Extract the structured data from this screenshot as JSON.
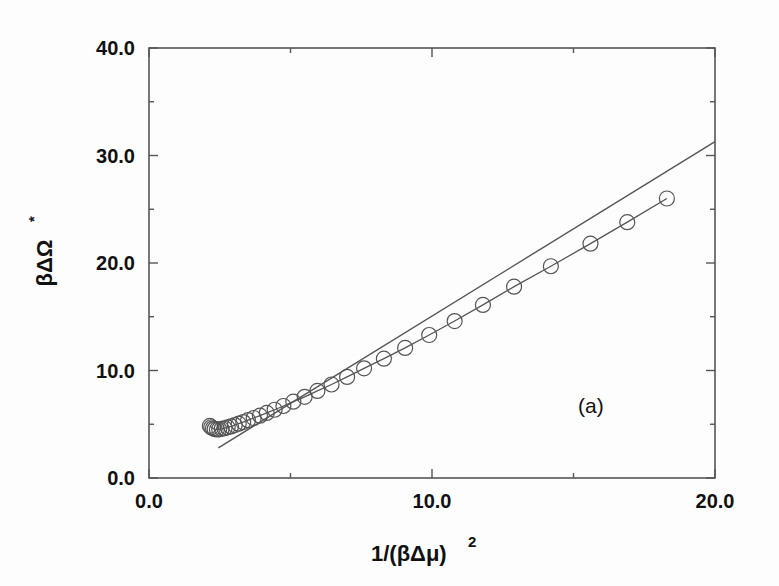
{
  "figure": {
    "panel_label": "(a)",
    "background_color": "#fdfdfd",
    "ink_color": "#555555"
  },
  "chart_data": {
    "type": "line",
    "title": "",
    "subtitle": "",
    "xlabel": "1/(βΔμ)²",
    "ylabel": "βΔΩ*",
    "xlabel_parts": {
      "base": "1/(βΔμ)",
      "exponent": "2"
    },
    "ylabel_parts": {
      "base": "βΔΩ",
      "exponent": "*"
    },
    "xlim": [
      0.0,
      20.0
    ],
    "ylim": [
      0.0,
      40.0
    ],
    "grid": false,
    "legend": null,
    "annotations": [
      {
        "text": "(a)",
        "x": 15.2,
        "y": 7.0
      }
    ],
    "xticks": [
      0.0,
      10.0,
      20.0
    ],
    "xtick_labels": [
      "0.0",
      "10.0",
      "20.0"
    ],
    "xminor_ticks": [
      5.0,
      15.0
    ],
    "yticks": [
      0.0,
      10.0,
      20.0,
      30.0,
      40.0
    ],
    "ytick_labels": [
      "0.0",
      "10.0",
      "20.0",
      "30.0",
      "40.0"
    ],
    "yminor_ticks": [
      5.0,
      15.0,
      25.0,
      35.0
    ],
    "series": [
      {
        "name": "simulation",
        "marker": "open-circle",
        "has_line": true,
        "x": [
          2.15,
          2.2,
          2.26,
          2.32,
          2.4,
          2.48,
          2.57,
          2.67,
          2.78,
          2.9,
          3.03,
          3.17,
          3.33,
          3.5,
          3.7,
          3.92,
          4.16,
          4.44,
          4.75,
          5.1,
          5.5,
          5.95,
          6.45,
          7.0,
          7.6,
          8.3,
          9.05,
          9.9,
          10.8,
          11.8,
          12.9,
          14.2,
          15.6,
          16.9,
          18.3
        ],
        "y": [
          4.85,
          4.72,
          4.62,
          4.55,
          4.52,
          4.53,
          4.57,
          4.63,
          4.71,
          4.8,
          4.92,
          5.05,
          5.2,
          5.38,
          5.58,
          5.8,
          6.05,
          6.35,
          6.7,
          7.1,
          7.55,
          8.1,
          8.7,
          9.4,
          10.2,
          11.1,
          12.1,
          13.3,
          14.6,
          16.1,
          17.8,
          19.7,
          21.8,
          23.8,
          26.0
        ]
      },
      {
        "name": "asymptotic-line",
        "marker": "none",
        "has_line": true,
        "x": [
          2.45,
          20.0
        ],
        "y": [
          2.8,
          31.3
        ]
      }
    ]
  }
}
